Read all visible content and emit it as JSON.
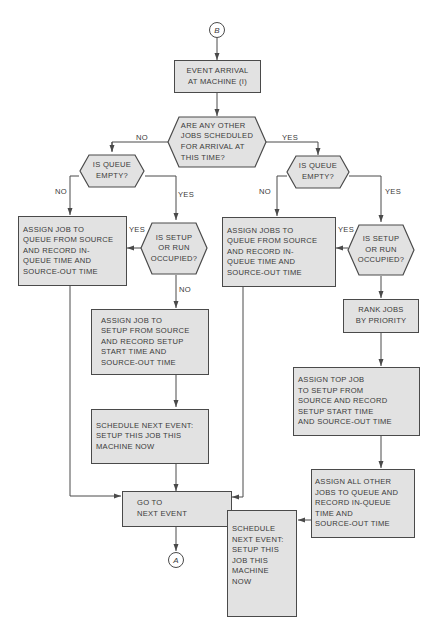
{
  "diagram": {
    "type": "flowchart",
    "connectors": {
      "start": "B",
      "end": "A"
    },
    "nodes": {
      "event_arrival": "EVENT ARRIVAL\nAT MACHINE (I)",
      "decision_other_jobs": "ARE ANY OTHER\nJOBS SCHEDULED\nFOR ARRIVAL AT\nTHIS TIME?",
      "decision_queue_empty_left": "IS QUEUE\nEMPTY?",
      "decision_queue_empty_right": "IS QUEUE\nEMPTY?",
      "assign_job_queue": "ASSIGN JOB TO\nQUEUE FROM SOURCE\nAND RECORD IN-\nQUEUE TIME AND\nSOURCE-OUT TIME",
      "decision_setup_left": "IS SETUP\nOR RUN\nOCCUPIED?",
      "assign_jobs_queue": "ASSIGN JOBS TO\nQUEUE FROM SOURCE\nAND RECORD IN-\nQUEUE TIME AND\nSOURCE-OUT TIME",
      "decision_setup_right": "IS SETUP\nOR RUN\nOCCUPIED?",
      "assign_job_setup": "ASSIGN JOB TO\nSETUP FROM SOURCE\nAND RECORD SETUP\nSTART TIME AND\nSOURCE-OUT TIME",
      "rank_jobs": "RANK JOBS\nBY PRIORITY",
      "schedule_left": "SCHEDULE NEXT EVENT:\nSETUP THIS JOB THIS\nMACHINE NOW",
      "assign_top_job": "ASSIGN TOP JOB\nTO SETUP FROM\nSOURCE AND RECORD\nSETUP START TIME\nAND SOURCE-OUT TIME",
      "assign_all_other": "ASSIGN ALL OTHER\nJOBS TO QUEUE AND\nRECORD IN-QUEUE\nTIME AND\nSOURCE-OUT TIME",
      "go_next_event": "GO TO\nNEXT EVENT",
      "schedule_right": "SCHEDULE\nNEXT EVENT:\nSETUP THIS\nJOB THIS\nMACHINE\nNOW"
    },
    "labels": {
      "no_top": "NO",
      "yes_top": "YES",
      "no_left_queue": "NO",
      "yes_left_queue": "YES",
      "yes_left_setup": "YES",
      "no_left_setup": "NO",
      "no_right_queue": "NO",
      "yes_right_queue": "YES",
      "yes_right_setup": "YES"
    },
    "colors": {
      "fill": "#e2e2e2",
      "stroke": "#4a4a4a",
      "text": "#3a3a3a"
    }
  }
}
